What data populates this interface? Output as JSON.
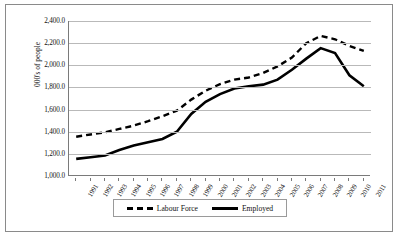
{
  "chart_data": {
    "type": "line",
    "title": "",
    "xlabel": "",
    "ylabel": "000's of people",
    "ylim": [
      1000.0,
      2400.0
    ],
    "ytick_labels": [
      "2,400.0",
      "2,200.0",
      "2,000.0",
      "1,800.0",
      "1,600.0",
      "1,400.0",
      "1,200.0",
      "1,000.0"
    ],
    "ytick_values": [
      2400.0,
      2200.0,
      2000.0,
      1800.0,
      1600.0,
      1400.0,
      1200.0,
      1000.0
    ],
    "grid": true,
    "legend_position": "bottom",
    "categories": [
      "1991",
      "1992",
      "1993",
      "1994",
      "1995",
      "1996",
      "1997",
      "1998",
      "1999",
      "2000",
      "2001",
      "2002",
      "2003",
      "2004",
      "2005",
      "2006",
      "2007",
      "2008",
      "2009",
      "2010",
      "2011"
    ],
    "series": [
      {
        "name": "Labour Force",
        "style": "dashed",
        "color": "#000000",
        "values": [
          1355,
          1375,
          1395,
          1425,
          1455,
          1495,
          1540,
          1590,
          1690,
          1770,
          1830,
          1870,
          1890,
          1930,
          1990,
          2070,
          2200,
          2265,
          2235,
          2175,
          2130
        ]
      },
      {
        "name": "Employed",
        "style": "solid",
        "color": "#000000",
        "values": [
          1155,
          1170,
          1185,
          1235,
          1275,
          1305,
          1335,
          1400,
          1560,
          1670,
          1740,
          1790,
          1810,
          1825,
          1870,
          1960,
          2060,
          2155,
          2110,
          1910,
          1810
        ]
      }
    ]
  },
  "legend": {
    "items": [
      {
        "label": "Labour Force",
        "style": "dashed"
      },
      {
        "label": "Employed",
        "style": "solid"
      }
    ]
  }
}
